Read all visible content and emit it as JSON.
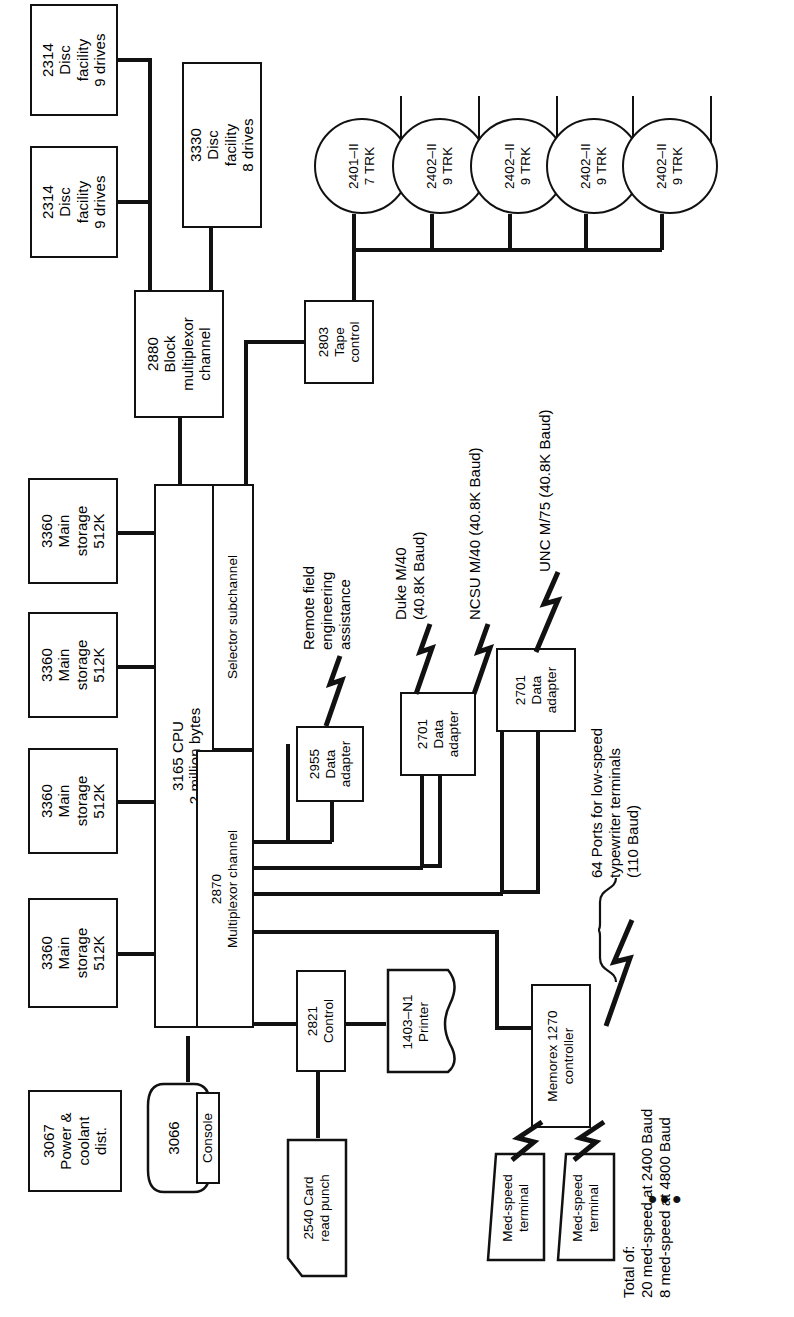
{
  "diagram": {
    "orientation": "rotated-90-ccw",
    "line_color": "#111111",
    "background": "#ffffff"
  },
  "storage": {
    "disc_2314_a": "2314\nDisc\nfacility\n9 drives",
    "disc_2314_b": "2314\nDisc\nfacility\n9 drives",
    "disc_3330": "3330\nDisc\nfacility\n8 drives"
  },
  "tapes": [
    {
      "label": "2401–II\n7 TRK"
    },
    {
      "label": "2402–II\n9 TRK"
    },
    {
      "label": "2402–II\n9 TRK"
    },
    {
      "label": "2402–II\n9 TRK"
    },
    {
      "label": "2402–II\n9 TRK"
    }
  ],
  "channels": {
    "block_mpx": "2880\nBlock\nmultiplexor\nchannel",
    "tape_control": "2803\nTape\ncontrol",
    "selector_subchannel": "Selector subchannel",
    "multiplexor_channel": "2870\nMultiplexor channel"
  },
  "cpu": {
    "label": "3165 CPU\n2 million bytes"
  },
  "memory": [
    {
      "label": "3360\nMain\nstorage\n512K"
    },
    {
      "label": "3360\nMain\nstorage\n512K"
    },
    {
      "label": "3360\nMain\nstorage\n512K"
    },
    {
      "label": "3360\nMain\nstorage\n512K"
    }
  ],
  "power": {
    "label": "3067\nPower &\ncoolant\ndist."
  },
  "console": {
    "unit_label": "3066",
    "panel_label": "Console"
  },
  "adapters": {
    "a2955": "2955\nData\nadapter",
    "a2701_1": "2701\nData\nadapter",
    "a2701_2": "2701\nData\nadapter"
  },
  "remote_links": {
    "field_engineering": "Remote field\nengineering\nassistance",
    "duke": "Duke M/40\n(40.8K Baud)",
    "ncsu": "NCSU M/40 (40.8K Baud)",
    "unc": "UNC M/75 (40.8K Baud)",
    "ports": "64 Ports for low-speed\ntypewriter terminals\n(110 Baud)"
  },
  "unit_record": {
    "control_2821": "2821\nControl",
    "printer_1403": "1403–N1\nPrinter",
    "card_2540": "2540 Card\nread punch"
  },
  "terminals": {
    "controller": "Memorex 1270\ncontroller",
    "med_speed_1": "Med-speed\nterminal",
    "med_speed_2": "Med-speed\nterminal",
    "ellipsis": "•••"
  },
  "totals": {
    "text": "Total of:\n20 med-speed at 2400 Baud\n8 med-speed at 4800 Baud"
  }
}
